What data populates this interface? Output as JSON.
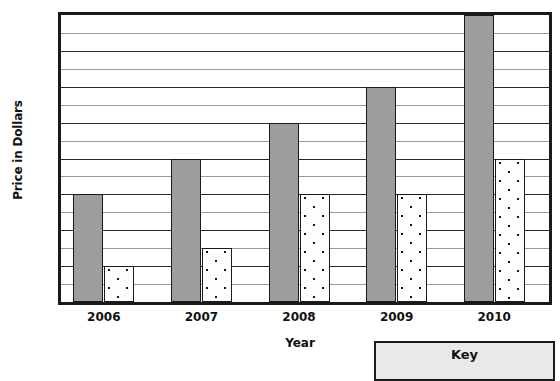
{
  "chart_data": {
    "type": "bar",
    "title": "",
    "subtitle": "",
    "xlabel": "Year",
    "ylabel": "Price in Dollars",
    "categories": [
      "2006",
      "2007",
      "2008",
      "2009",
      "2010"
    ],
    "series": [
      {
        "name": "solid-gray-series",
        "values": [
          3,
          4,
          5,
          6,
          8
        ],
        "fill": "solid-gray",
        "color": "#9d9d9d"
      },
      {
        "name": "dotted-white-series",
        "values": [
          1,
          1.5,
          3,
          3,
          4
        ],
        "fill": "dotted-white",
        "color": "#fdfdfd"
      }
    ],
    "ylim": [
      0,
      8
    ],
    "y_ticks": [
      0,
      1,
      2,
      3,
      4,
      5,
      6,
      7,
      8
    ],
    "y_tick_labels": [
      "0",
      "1",
      "2",
      "3",
      "4",
      "5",
      "6",
      "7",
      "$8"
    ],
    "y_minor_ticks": [
      0.5,
      1.5,
      2.5,
      3.5,
      4.5,
      5.5,
      6.5,
      7.5
    ],
    "grid": true,
    "grid_axis": "y",
    "legend_position": "bottom-right"
  },
  "legend": {
    "title": "Key"
  },
  "colors": {
    "axis": "#1a1a1a",
    "gridline_major": "#2a2a2a",
    "gridline_minor": "#9a9a9a",
    "bar_solid": "#9d9d9d",
    "bar_dotted_bg": "#fdfdfd",
    "bar_dotted_dot": "#151515",
    "legend_bg": "#e9e9e9",
    "text": "#111111"
  }
}
